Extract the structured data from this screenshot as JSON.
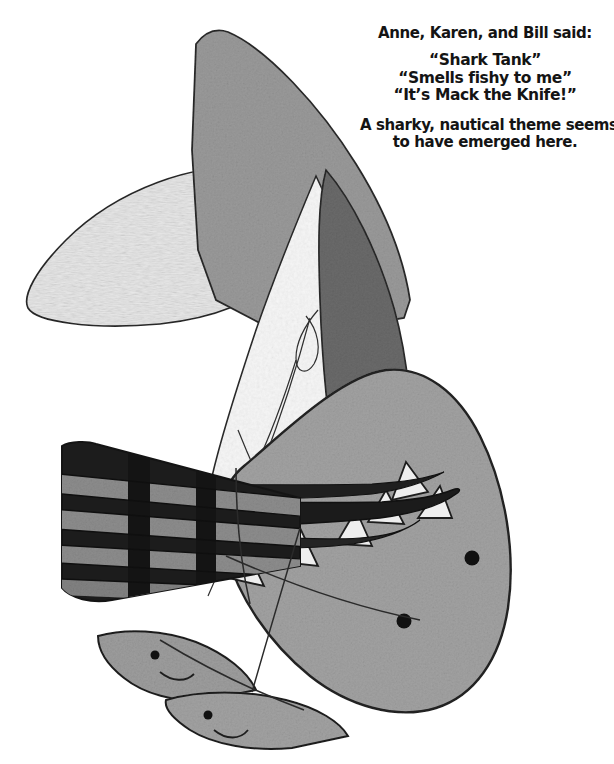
{
  "page": {
    "width": 614,
    "height": 764,
    "background": "#ffffff"
  },
  "caption": {
    "heading": "Anne, Karen, and Bill said:",
    "quotes": [
      "“Shark Tank”",
      "“Smells fishy to me”",
      "“It’s Mack the Knife!”"
    ],
    "summary_lines": [
      "A sharky, nautical theme seems",
      "to have emerged here."
    ],
    "text_color": "#141414"
  },
  "artwork": {
    "kind": "hand-drawn-pencil-ink-illustration",
    "subject": "abstract overlapping shark shapes, sailboat sail, knife blade and striped handle",
    "palette": {
      "outline": "#1d1d1d",
      "fin_gray": "#9a9a9a",
      "body_gray": "#a2a2a2",
      "dark_gray": "#676767",
      "mid_dark_gray": "#7b7b7b",
      "light_gray": "#e7e7e7",
      "pale_gray": "#efefef",
      "sail_white": "#f4f4f4",
      "blade_black": "#1a1a1a",
      "stripe_gray": "#8d8d8d",
      "paper": "#ffffff"
    },
    "elements": [
      {
        "name": "large-dorsal-fin",
        "fill": "#9a9a9a",
        "note": "tall curved shark fin, upper center"
      },
      {
        "name": "left-pectoral-fin",
        "fill": "#e7e7e7",
        "note": "pale textured ellipse pointing left"
      },
      {
        "name": "dark-flank",
        "fill": "#676767",
        "note": "dark gray tapering wedge, right of sail"
      },
      {
        "name": "sail",
        "fill": "#f4f4f4",
        "note": "white triangular sail with thin rigging lines"
      },
      {
        "name": "shark-head-body",
        "fill": "#a2a2a2",
        "note": "large rounded head lower right"
      },
      {
        "name": "shark-teeth",
        "fill": "#eeeeee",
        "note": "row of triangular teeth along the jaw"
      },
      {
        "name": "knife-blade",
        "fill": "#1a1a1a",
        "note": "long dark blade crossing the jaw"
      },
      {
        "name": "knife-handle",
        "fill": "#1a1a1a",
        "note": "striped banded handle at left"
      },
      {
        "name": "small-shark-head-upper",
        "fill": "#9d9d9d",
        "note": "small smiling shark face with eye"
      },
      {
        "name": "small-shark-head-lower",
        "fill": "#a2a2a2",
        "note": "second small smiling shark face"
      },
      {
        "name": "eye-upper",
        "fill": "#111111"
      },
      {
        "name": "eye-lower",
        "fill": "#111111"
      },
      {
        "name": "small-eye-upper",
        "fill": "#111111"
      },
      {
        "name": "small-eye-lower",
        "fill": "#111111"
      }
    ],
    "stripe_count": 5
  }
}
